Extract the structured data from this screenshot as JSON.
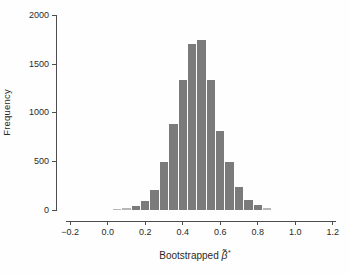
{
  "figure": {
    "background": "#fefefe"
  },
  "chart_data": {
    "type": "bar",
    "subtype": "histogram",
    "title": "",
    "ylabel": "Frequency",
    "xlabel": {
      "prefix": "Bootstrapped ",
      "symbol": "β̃",
      "superscript": "*"
    },
    "bin_width": 0.05,
    "bin_centers": [
      0.05,
      0.1,
      0.15,
      0.2,
      0.25,
      0.3,
      0.35,
      0.4,
      0.45,
      0.5,
      0.55,
      0.6,
      0.65,
      0.7,
      0.75,
      0.8,
      0.85
    ],
    "frequencies": [
      12,
      22,
      45,
      90,
      210,
      490,
      890,
      1340,
      1710,
      1745,
      1340,
      810,
      490,
      240,
      105,
      48,
      20
    ],
    "x_ticks": {
      "labels": [
        "−0.2",
        "0.0",
        "0.2",
        "0.4",
        "0.6",
        "0.8",
        "1.0",
        "1.2"
      ],
      "values": [
        -0.2,
        0.0,
        0.2,
        0.4,
        0.6,
        0.8,
        1.0,
        1.2
      ]
    },
    "y_ticks": {
      "labels": [
        "0",
        "500",
        "1000",
        "1500",
        "2000"
      ],
      "values": [
        0,
        500,
        1000,
        1500,
        2000
      ]
    },
    "xlim": [
      -0.2,
      1.2
    ],
    "ylim": [
      0,
      2000
    ],
    "grid": false,
    "legend": null,
    "bar_color": "#7b7b7b",
    "axis_color": "#4d4d4f",
    "text_color": "#2b2a29"
  }
}
